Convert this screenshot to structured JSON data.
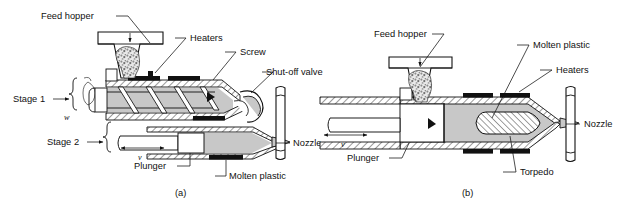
{
  "figure": {
    "background": "#ffffff",
    "ink": "#111111",
    "melt_color": "#c8c8c8"
  },
  "panels": [
    {
      "id": "a",
      "caption": "(a)",
      "name": "reciprocating-screw-injection-unit",
      "labels": [
        {
          "key": "feed_hopper",
          "text": "Feed hopper"
        },
        {
          "key": "heaters",
          "text": "Heaters"
        },
        {
          "key": "screw",
          "text": "Screw"
        },
        {
          "key": "shut_off_valve",
          "text": "Shut-off valve"
        },
        {
          "key": "nozzle",
          "text": "Nozzle"
        },
        {
          "key": "plunger",
          "text": "Plunger"
        },
        {
          "key": "molten_plastic",
          "text": "Molten plastic"
        },
        {
          "key": "stage_1",
          "text": "Stage 1"
        },
        {
          "key": "stage_2",
          "text": "Stage 2"
        }
      ],
      "annotations": [
        {
          "key": "rotation_symbol",
          "text": "w"
        },
        {
          "key": "velocity_symbol",
          "text": "v"
        }
      ]
    },
    {
      "id": "b",
      "caption": "(b)",
      "name": "plunger-torpedo-injection-unit",
      "labels": [
        {
          "key": "feed_hopper",
          "text": "Feed hopper"
        },
        {
          "key": "molten_plastic",
          "text": "Molten plastic"
        },
        {
          "key": "heaters",
          "text": "Heaters"
        },
        {
          "key": "nozzle",
          "text": "Nozzle"
        },
        {
          "key": "plunger",
          "text": "Plunger"
        },
        {
          "key": "torpedo",
          "text": "Torpedo"
        }
      ],
      "annotations": [
        {
          "key": "velocity_symbol",
          "text": "v"
        }
      ]
    }
  ]
}
